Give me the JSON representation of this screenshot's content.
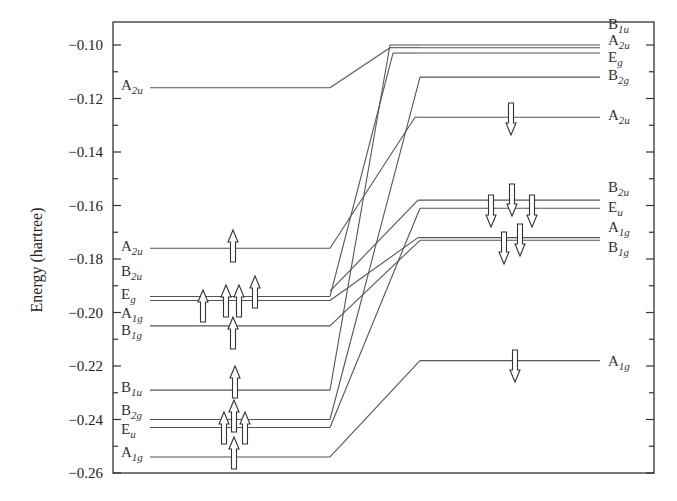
{
  "chart_data": {
    "type": "energy-level-diagram",
    "title": "",
    "ylabel": "Energy (hartree)",
    "xlabel": "",
    "ylim": [
      -0.26,
      -0.09
    ],
    "y_ticks": [
      -0.1,
      -0.12,
      -0.14,
      -0.16,
      -0.18,
      -0.2,
      -0.22,
      -0.24,
      -0.26
    ],
    "y_tick_labels": [
      "−0.10",
      "−0.12",
      "−0.14",
      "−0.16",
      "−0.18",
      "−0.20",
      "−0.22",
      "−0.24",
      "−0.26"
    ],
    "left_levels": [
      {
        "sym": "A",
        "sub": "2u",
        "energy": -0.116,
        "spin": []
      },
      {
        "sym": "A",
        "sub": "2u",
        "energy": -0.176,
        "spin": [
          "up"
        ]
      },
      {
        "sym": "B",
        "sub": "2u",
        "energy": null,
        "label_only": true,
        "label_energy": -0.184
      },
      {
        "sym": "E",
        "sub": "g",
        "energy": -0.194,
        "spin": [
          "up",
          "up",
          "up",
          "up"
        ]
      },
      {
        "sym": "A",
        "sub": "1g",
        "energy": -0.196,
        "spin": []
      },
      {
        "sym": "B",
        "sub": "1g",
        "energy": -0.205,
        "spin": [
          "up"
        ]
      },
      {
        "sym": "B",
        "sub": "1u",
        "energy": -0.229,
        "spin": [
          "up"
        ]
      },
      {
        "sym": "B",
        "sub": "2g",
        "energy": -0.24,
        "spin": [
          "up"
        ]
      },
      {
        "sym": "E",
        "sub": "u",
        "energy": -0.243,
        "spin": [
          "up",
          "up"
        ]
      },
      {
        "sym": "A",
        "sub": "1g",
        "energy": -0.254,
        "spin": [
          "up"
        ]
      }
    ],
    "right_levels": [
      {
        "sym": "B",
        "sub": "1u",
        "energy": -0.1,
        "spin": []
      },
      {
        "sym": "A",
        "sub": "2u",
        "energy": -0.101,
        "spin": []
      },
      {
        "sym": "E",
        "sub": "g",
        "energy": -0.103,
        "spin": []
      },
      {
        "sym": "B",
        "sub": "2g",
        "energy": -0.112,
        "spin": []
      },
      {
        "sym": "A",
        "sub": "2u",
        "energy": -0.127,
        "spin": [
          "down"
        ]
      },
      {
        "sym": "B",
        "sub": "2u",
        "energy": -0.158,
        "spin": [
          "down"
        ]
      },
      {
        "sym": "E",
        "sub": "u",
        "energy": -0.161,
        "spin": [
          "down",
          "down"
        ]
      },
      {
        "sym": "A",
        "sub": "1g",
        "energy": -0.172,
        "spin": [
          "down"
        ]
      },
      {
        "sym": "B",
        "sub": "1g",
        "energy": -0.173,
        "spin": [
          "down"
        ]
      },
      {
        "sym": "A",
        "sub": "1g",
        "energy": -0.218,
        "spin": [
          "down"
        ]
      }
    ],
    "correlations": [
      {
        "from": "A2u(-0.116)",
        "to": "A2u(-0.101)"
      },
      {
        "from": "A2u(-0.176)",
        "to": "A2u(-0.127)"
      },
      {
        "from": "Eg(-0.194)",
        "to": "Eg(-0.103)"
      },
      {
        "from": "A1g(-0.196)",
        "to": "A1g(-0.172)"
      },
      {
        "from": "B1g(-0.205)",
        "to": "B1g(-0.173)"
      },
      {
        "from": "B1u(-0.229)",
        "to": "B1u(-0.100)"
      },
      {
        "from": "B2g(-0.240)",
        "to": "B2g(-0.112)"
      },
      {
        "from": "Eu(-0.243)",
        "to": "Eu(-0.161)"
      },
      {
        "from": "A1g(-0.254)",
        "to": "A1g(-0.218)"
      },
      {
        "from": "B2u(-0.194)",
        "to": "B2u(-0.158)"
      }
    ],
    "colors": {
      "line": "#555555",
      "frame": "#333333",
      "text": "#222222"
    }
  }
}
